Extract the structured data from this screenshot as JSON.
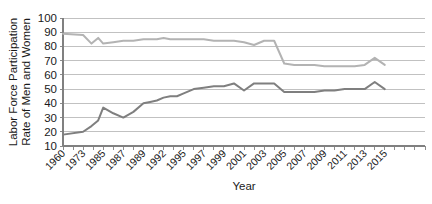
{
  "chart_data": {
    "type": "line",
    "title": "",
    "xlabel": "Year",
    "ylabel": "Labor Force Participation Rate of Men and Women",
    "ylim": [
      10,
      100
    ],
    "ytick_step": 10,
    "ytick_labels": [
      "100",
      "90",
      "80",
      "70",
      "60",
      "50",
      "40",
      "30",
      "20",
      "10"
    ],
    "ytick_values": [
      100,
      90,
      80,
      70,
      60,
      50,
      40,
      30,
      20,
      10
    ],
    "grid": "horizontal",
    "legend": "none",
    "x_axis_labeled_ticks": [
      "1960",
      "1973",
      "1985",
      "1987",
      "1989",
      "1992",
      "1995",
      "1997",
      "1999",
      "2001",
      "2003",
      "2005",
      "2007",
      "2009",
      "2011",
      "2013",
      "2015"
    ],
    "x_tick_count": 37,
    "x_label_rotation_deg": 45,
    "x": [
      1960,
      1973,
      1978,
      1982,
      1985,
      1986,
      1987,
      1988,
      1989,
      1990,
      1991,
      1992,
      1993,
      1994,
      1995,
      1996,
      1997,
      1998,
      1999,
      2000,
      2001,
      2002,
      2003,
      2004,
      2005,
      2006,
      2007,
      2008,
      2009,
      2010,
      2011,
      2012,
      2013,
      2014,
      2015
    ],
    "series": [
      {
        "name": "Men",
        "color": "#b3b3b3",
        "values": [
          89,
          88,
          82,
          86,
          82,
          83,
          84,
          84,
          85,
          85,
          85,
          86,
          85,
          85,
          85,
          85,
          85,
          84,
          84,
          84,
          83,
          81,
          84,
          84,
          68,
          67,
          67,
          67,
          66,
          66,
          66,
          66,
          67,
          72,
          67
        ]
      },
      {
        "name": "Women",
        "color": "#7f7f7f",
        "values": [
          18,
          20,
          24,
          28,
          37,
          33,
          30,
          34,
          40,
          41,
          42,
          44,
          45,
          45,
          47,
          50,
          51,
          52,
          52,
          54,
          49,
          54,
          54,
          54,
          48,
          48,
          48,
          48,
          49,
          49,
          50,
          50,
          50,
          55,
          50
        ]
      }
    ]
  },
  "axis": {
    "y_title": "Labor Force Participation Rate of Men and Women",
    "x_title": "Year"
  }
}
